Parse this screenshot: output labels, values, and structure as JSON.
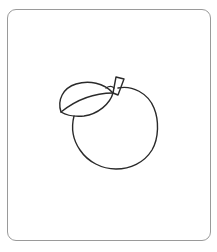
{
  "figure": {
    "parts": [
      "fruit-body",
      "leaf",
      "leaf-midrib",
      "stem"
    ],
    "stroke_color": "#2a2a2a",
    "frame_color": "#9a9a9a",
    "background": "#ffffff"
  }
}
